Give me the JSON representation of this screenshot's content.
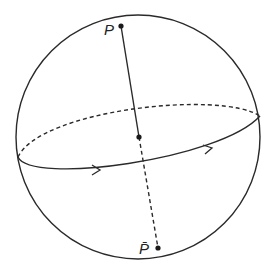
{
  "diagram": {
    "labels": {
      "north_pole": "P",
      "south_pole": "P̄"
    },
    "colors": {
      "stroke": "#2a2a2a",
      "background": "#ffffff"
    }
  }
}
